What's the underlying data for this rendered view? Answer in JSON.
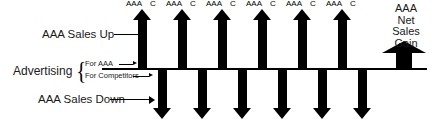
{
  "diagram": {
    "baseline_color": "#000000",
    "arrow_color": "#000000"
  },
  "annotations": {
    "sales_up": "AAA Sales Up",
    "sales_down": "AAA Sales Down",
    "advertising": "Advertising",
    "brace": "{",
    "for_aaa": "For AAA",
    "for_competitors": "For Competitors"
  },
  "netgain": {
    "line1": "AAA",
    "line2": "Net",
    "line3": "Sales",
    "line4": "Gain"
  },
  "baseline_ticks": {
    "aaa_label": "AAA",
    "c_label": "C",
    "aaa_positions": [
      126,
      166,
      206,
      246,
      286,
      326
    ],
    "c_positions": [
      150,
      190,
      230,
      270,
      310,
      350
    ]
  },
  "arrows": {
    "up_label": "up-arrow",
    "down_label": "down-arrow",
    "netgain_label": "net-gain-arrow",
    "up_positions": [
      142,
      182,
      222,
      262,
      302,
      342
    ],
    "down_positions": [
      162,
      202,
      242,
      282,
      322,
      362
    ],
    "netgain_position": 404
  }
}
